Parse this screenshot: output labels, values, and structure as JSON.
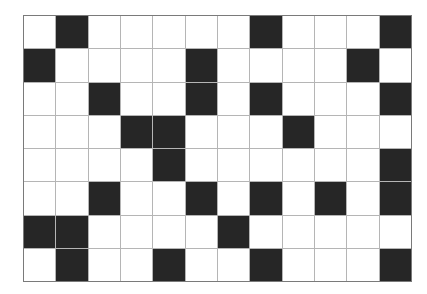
{
  "board": {
    "rows": 8,
    "cols": 12,
    "colors": {
      "filled": "#262626",
      "empty": "#ffffff",
      "gridline": "#b5b5b5",
      "border": "#7a7a7a"
    },
    "cells": [
      [
        0,
        1,
        0,
        0,
        0,
        0,
        0,
        1,
        0,
        0,
        0,
        1
      ],
      [
        1,
        0,
        0,
        0,
        0,
        1,
        0,
        0,
        0,
        0,
        1,
        0
      ],
      [
        0,
        0,
        1,
        0,
        0,
        1,
        0,
        1,
        0,
        0,
        0,
        1
      ],
      [
        0,
        0,
        0,
        1,
        1,
        0,
        0,
        0,
        1,
        0,
        0,
        0
      ],
      [
        0,
        0,
        0,
        0,
        1,
        0,
        0,
        0,
        0,
        0,
        0,
        1
      ],
      [
        0,
        0,
        1,
        0,
        0,
        1,
        0,
        1,
        0,
        1,
        0,
        1
      ],
      [
        1,
        1,
        0,
        0,
        0,
        0,
        1,
        0,
        0,
        0,
        0,
        0
      ],
      [
        0,
        1,
        0,
        0,
        1,
        0,
        0,
        1,
        0,
        0,
        0,
        1
      ]
    ]
  }
}
